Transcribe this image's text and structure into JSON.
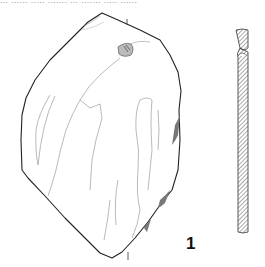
{
  "figure": {
    "caption_fragment": "... ...... ..... ....... ... ....... ..... ......",
    "label": "1",
    "views": [
      "face-view",
      "cross-section"
    ],
    "colors": {
      "outline": "#222222",
      "detail": "#8a8a8a",
      "hatch": "#555555",
      "background": "#ffffff"
    }
  }
}
